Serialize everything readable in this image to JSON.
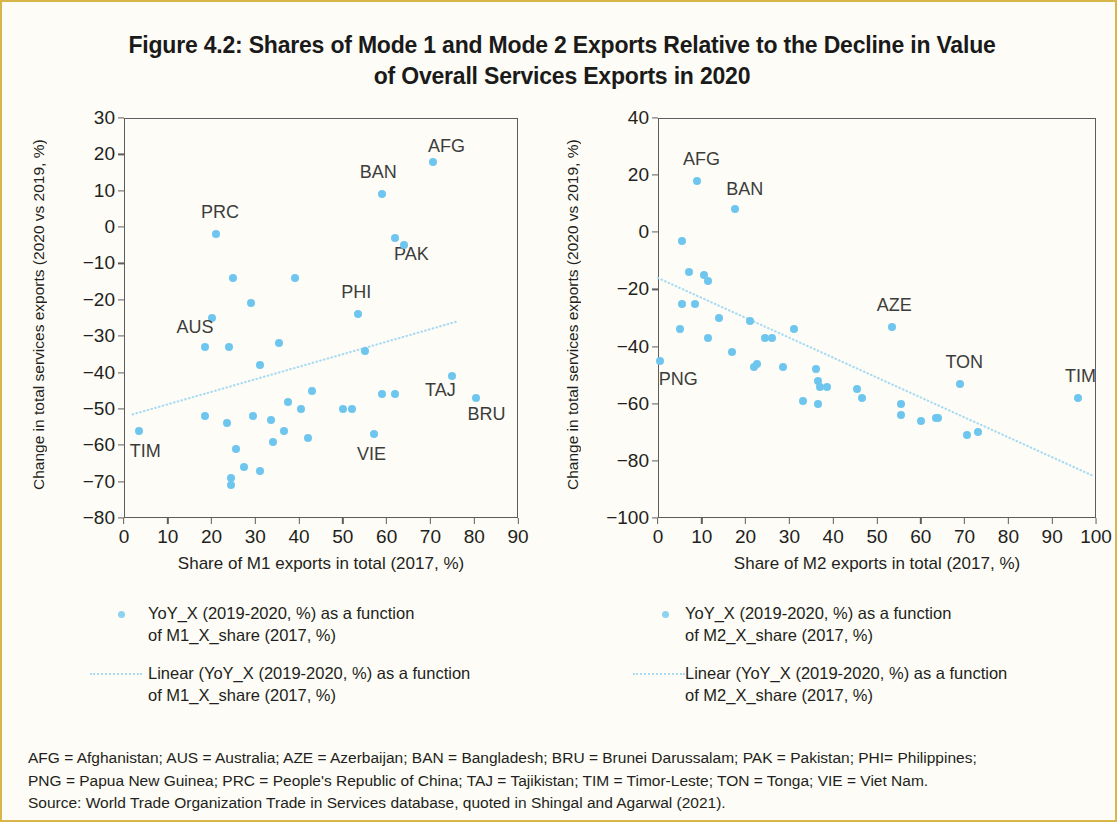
{
  "figure": {
    "title": "Figure 4.2: Shares of Mode 1 and Mode 2 Exports Relative to the Decline in Value of Overall Services Exports in 2020",
    "title_line1": "Figure 4.2: Shares of Mode 1 and Mode 2 Exports Relative to the Decline in Value",
    "title_line2": "of Overall Services Exports in 2020",
    "marker_color": "#6ec6ee",
    "trend_color": "#a9dcf2",
    "axis_color": "#5d5d5d",
    "page_border_color": "#d8b64a"
  },
  "notes": {
    "line1": "AFG = Afghanistan; AUS = Australia; AZE = Azerbaijan; BAN = Bangladesh; BRU = Brunei Darussalam; PAK = Pakistan; PHI= Philippines;",
    "line2": "PNG = Papua New Guinea; PRC = People's Republic of China; TAJ = Tajikistan; TIM = Timor-Leste; TON = Tonga; VIE = Viet Nam.",
    "line3": "Source: World Trade Organization Trade in Services database, quoted in Shingal and Agarwal (2021)."
  },
  "legend_left": {
    "series_label": "YoY_X (2019-2020, %) as a function of M1_X_share (2017, %)",
    "trend_label": "Linear (YoY_X (2019-2020, %) as a function of M1_X_share (2017, %))",
    "series_line1": "YoY_X (2019-2020, %) as a function",
    "series_line2": "of M1_X_share (2017, %)",
    "trend_line1": "Linear (YoY_X (2019-2020, %) as a function",
    "trend_line2": "of M1_X_share (2017, %)"
  },
  "legend_right": {
    "series_label": "YoY_X (2019-2020, %) as a function of M2_X_share (2017, %)",
    "trend_label": "Linear (YoY_X (2019-2020, %) as a function of M2_X_share (2017, %))",
    "series_line1": "YoY_X (2019-2020, %) as a function",
    "series_line2": "of M2_X_share (2017, %)",
    "trend_line1": "Linear (YoY_X (2019-2020, %) as a function",
    "trend_line2": "of M2_X_share (2017, %)"
  },
  "chart_data": [
    {
      "id": "m1",
      "type": "scatter",
      "title": "",
      "xlabel": "Share of M1 exports in total (2017, %)",
      "ylabel": "Change in total services exports (2020 vs 2019, %)",
      "xlim": [
        0,
        90
      ],
      "ylim": [
        -80,
        30
      ],
      "xticks": [
        0,
        10,
        20,
        30,
        40,
        50,
        60,
        70,
        80,
        90
      ],
      "yticks": [
        30,
        20,
        10,
        0,
        -10,
        -20,
        -30,
        -40,
        -50,
        -60,
        -70,
        -80
      ],
      "grid": false,
      "legend_position": "below",
      "series": [
        {
          "name": "YoY_X (2019-2020, %) as a function of M1_X_share (2017, %)",
          "color": "#6ec6ee",
          "points": [
            {
              "x": 70.5,
              "y": 18,
              "label": "AFG"
            },
            {
              "x": 59.0,
              "y": 9,
              "label": "BAN"
            },
            {
              "x": 21.0,
              "y": -2,
              "label": "PRC"
            },
            {
              "x": 62.0,
              "y": -3,
              "label": "PAK"
            },
            {
              "x": 64.0,
              "y": -5,
              "label": null
            },
            {
              "x": 25.0,
              "y": -14,
              "label": null
            },
            {
              "x": 39.0,
              "y": -14,
              "label": null
            },
            {
              "x": 29.0,
              "y": -21,
              "label": null
            },
            {
              "x": 20.0,
              "y": -25,
              "label": null
            },
            {
              "x": 53.5,
              "y": -24,
              "label": "PHI"
            },
            {
              "x": 18.5,
              "y": -33,
              "label": "AUS"
            },
            {
              "x": 24.0,
              "y": -33,
              "label": null
            },
            {
              "x": 35.5,
              "y": -32,
              "label": null
            },
            {
              "x": 31.0,
              "y": -38,
              "label": null
            },
            {
              "x": 55.0,
              "y": -34,
              "label": null
            },
            {
              "x": 75.0,
              "y": -41,
              "label": "TAJ"
            },
            {
              "x": 80.5,
              "y": -47,
              "label": "BRU"
            },
            {
              "x": 59.0,
              "y": -46,
              "label": null
            },
            {
              "x": 62.0,
              "y": -46,
              "label": null
            },
            {
              "x": 43.0,
              "y": -45,
              "label": null
            },
            {
              "x": 18.5,
              "y": -52,
              "label": null
            },
            {
              "x": 29.5,
              "y": -52,
              "label": null
            },
            {
              "x": 37.5,
              "y": -48,
              "label": null
            },
            {
              "x": 50.0,
              "y": -50,
              "label": null
            },
            {
              "x": 52.0,
              "y": -50,
              "label": null
            },
            {
              "x": 40.5,
              "y": -50,
              "label": null
            },
            {
              "x": 23.5,
              "y": -54,
              "label": null
            },
            {
              "x": 33.5,
              "y": -53,
              "label": null
            },
            {
              "x": 3.5,
              "y": -56,
              "label": "TIM"
            },
            {
              "x": 36.5,
              "y": -56,
              "label": null
            },
            {
              "x": 57.0,
              "y": -57,
              "label": "VIE"
            },
            {
              "x": 42.0,
              "y": -58,
              "label": null
            },
            {
              "x": 34.0,
              "y": -59,
              "label": null
            },
            {
              "x": 25.5,
              "y": -61,
              "label": null
            },
            {
              "x": 31.0,
              "y": -67,
              "label": null
            },
            {
              "x": 27.5,
              "y": -66,
              "label": null
            },
            {
              "x": 24.5,
              "y": -69,
              "label": null
            },
            {
              "x": 24.5,
              "y": -71,
              "label": null
            }
          ]
        }
      ],
      "trendline": {
        "name": "Linear (YoY_X (2019-2020, %) as a function of M1_X_share (2017, %))",
        "color": "#a9dcf2",
        "style": "dotted",
        "x0": 2.0,
        "y0": -51.5,
        "x1": 76.0,
        "y1": -26.0,
        "slope": 0.345,
        "intercept": -52.2
      },
      "point_labels": [
        "AFG",
        "BAN",
        "PRC",
        "PAK",
        "PHI",
        "AUS",
        "TAJ",
        "BRU",
        "TIM",
        "VIE"
      ]
    },
    {
      "id": "m2",
      "type": "scatter",
      "title": "",
      "xlabel": "Share of M2 exports in total (2017, %)",
      "ylabel": "Change in total services exports (2020 vs 2019, %)",
      "xlim": [
        0,
        100
      ],
      "ylim": [
        -100,
        40
      ],
      "xticks": [
        0,
        10,
        20,
        30,
        40,
        50,
        60,
        70,
        80,
        90,
        100
      ],
      "yticks": [
        40,
        20,
        0,
        -20,
        -40,
        -60,
        -80,
        -100
      ],
      "grid": false,
      "legend_position": "below",
      "series": [
        {
          "name": "YoY_X (2019-2020, %) as a function of M2_X_share (2017, %)",
          "color": "#6ec6ee",
          "points": [
            {
              "x": 9.0,
              "y": 18,
              "label": "AFG"
            },
            {
              "x": 17.5,
              "y": 8,
              "label": "BAN"
            },
            {
              "x": 5.5,
              "y": -3,
              "label": null
            },
            {
              "x": 7.0,
              "y": -14,
              "label": null
            },
            {
              "x": 10.5,
              "y": -15,
              "label": null
            },
            {
              "x": 11.5,
              "y": -17,
              "label": null
            },
            {
              "x": 5.5,
              "y": -25,
              "label": null
            },
            {
              "x": 8.5,
              "y": -25,
              "label": null
            },
            {
              "x": 14.0,
              "y": -30,
              "label": null
            },
            {
              "x": 21.0,
              "y": -31,
              "label": null
            },
            {
              "x": 5.0,
              "y": -34,
              "label": null
            },
            {
              "x": 31.0,
              "y": -34,
              "label": null
            },
            {
              "x": 11.5,
              "y": -37,
              "label": null
            },
            {
              "x": 24.5,
              "y": -37,
              "label": null
            },
            {
              "x": 26.0,
              "y": -37,
              "label": null
            },
            {
              "x": 17.0,
              "y": -42,
              "label": null
            },
            {
              "x": 22.5,
              "y": -46,
              "label": null
            },
            {
              "x": 53.5,
              "y": -33,
              "label": "AZE"
            },
            {
              "x": 0.5,
              "y": -45,
              "label": "PNG"
            },
            {
              "x": 22.0,
              "y": -47,
              "label": null
            },
            {
              "x": 28.5,
              "y": -47,
              "label": null
            },
            {
              "x": 36.0,
              "y": -48,
              "label": null
            },
            {
              "x": 36.5,
              "y": -52,
              "label": null
            },
            {
              "x": 37.0,
              "y": -54,
              "label": null
            },
            {
              "x": 38.5,
              "y": -54,
              "label": null
            },
            {
              "x": 45.5,
              "y": -55,
              "label": null
            },
            {
              "x": 33.0,
              "y": -59,
              "label": null
            },
            {
              "x": 46.5,
              "y": -58,
              "label": null
            },
            {
              "x": 36.5,
              "y": -60,
              "label": null
            },
            {
              "x": 69.0,
              "y": -53,
              "label": "TON"
            },
            {
              "x": 96.0,
              "y": -58,
              "label": "TIM"
            },
            {
              "x": 55.5,
              "y": -60,
              "label": null
            },
            {
              "x": 55.5,
              "y": -64,
              "label": null
            },
            {
              "x": 60.0,
              "y": -66,
              "label": null
            },
            {
              "x": 63.5,
              "y": -65,
              "label": null
            },
            {
              "x": 64.0,
              "y": -65,
              "label": null
            },
            {
              "x": 70.5,
              "y": -71,
              "label": null
            },
            {
              "x": 73.0,
              "y": -70,
              "label": null
            }
          ]
        }
      ],
      "trendline": {
        "name": "Linear (YoY_X (2019-2020, %) as a function of M2_X_share (2017, %))",
        "color": "#a9dcf2",
        "style": "dotted",
        "x0": 0.0,
        "y0": -16.0,
        "x1": 99.0,
        "y1": -85.0,
        "slope": -0.697,
        "intercept": -16.0
      },
      "point_labels": [
        "AFG",
        "BAN",
        "AZE",
        "PNG",
        "TON",
        "TIM"
      ]
    }
  ]
}
